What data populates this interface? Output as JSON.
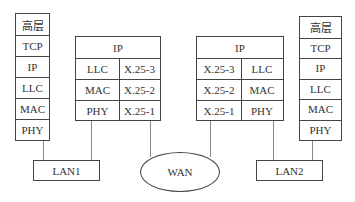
{
  "diagram": {
    "host_left": {
      "layers": [
        "高层",
        "TCP",
        "IP",
        "LLC",
        "MAC",
        "PHY"
      ]
    },
    "router_left": {
      "top": "IP",
      "left_col": [
        "LLC",
        "MAC",
        "PHY"
      ],
      "right_col": [
        "X.25-3",
        "X.25-2",
        "X.25-1"
      ]
    },
    "router_right": {
      "top": "IP",
      "left_col": [
        "X.25-3",
        "X.25-2",
        "X.25-1"
      ],
      "right_col": [
        "LLC",
        "MAC",
        "PHY"
      ]
    },
    "host_right": {
      "layers": [
        "高层",
        "TCP",
        "IP",
        "LLC",
        "MAC",
        "PHY"
      ]
    },
    "networks": {
      "lan1": "LAN1",
      "wan": "WAN",
      "lan2": "LAN2"
    }
  }
}
